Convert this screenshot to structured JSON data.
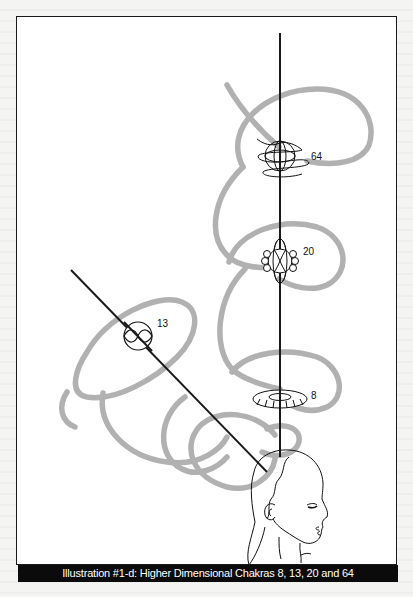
{
  "figure": {
    "caption": "Illustration #1-d: Higher Dimensional Chakras 8, 13, 20 and 64",
    "colors": {
      "frame_border": "#1a1a1a",
      "caption_background": "#0b0b0b",
      "caption_text": "#ffffff",
      "spiral_stroke": "#a9a9a9",
      "axis_stroke": "#1a1a1a",
      "line_art": "#111111"
    }
  },
  "chakras": [
    {
      "id": "chakra-64",
      "label": "64",
      "shape": "orb-with-loops"
    },
    {
      "id": "chakra-20",
      "label": "20",
      "shape": "lotus-orb"
    },
    {
      "id": "chakra-13",
      "label": "13",
      "shape": "circle-with-infinity"
    },
    {
      "id": "chakra-8",
      "label": "8",
      "shape": "torus-ring"
    }
  ],
  "elements": {
    "vertical_axis": "vertical-energy-axis",
    "diagonal_axis": "diagonal-energy-axis",
    "spirals": "gray-spiral-energy-streams",
    "head": "human-head-profile"
  }
}
